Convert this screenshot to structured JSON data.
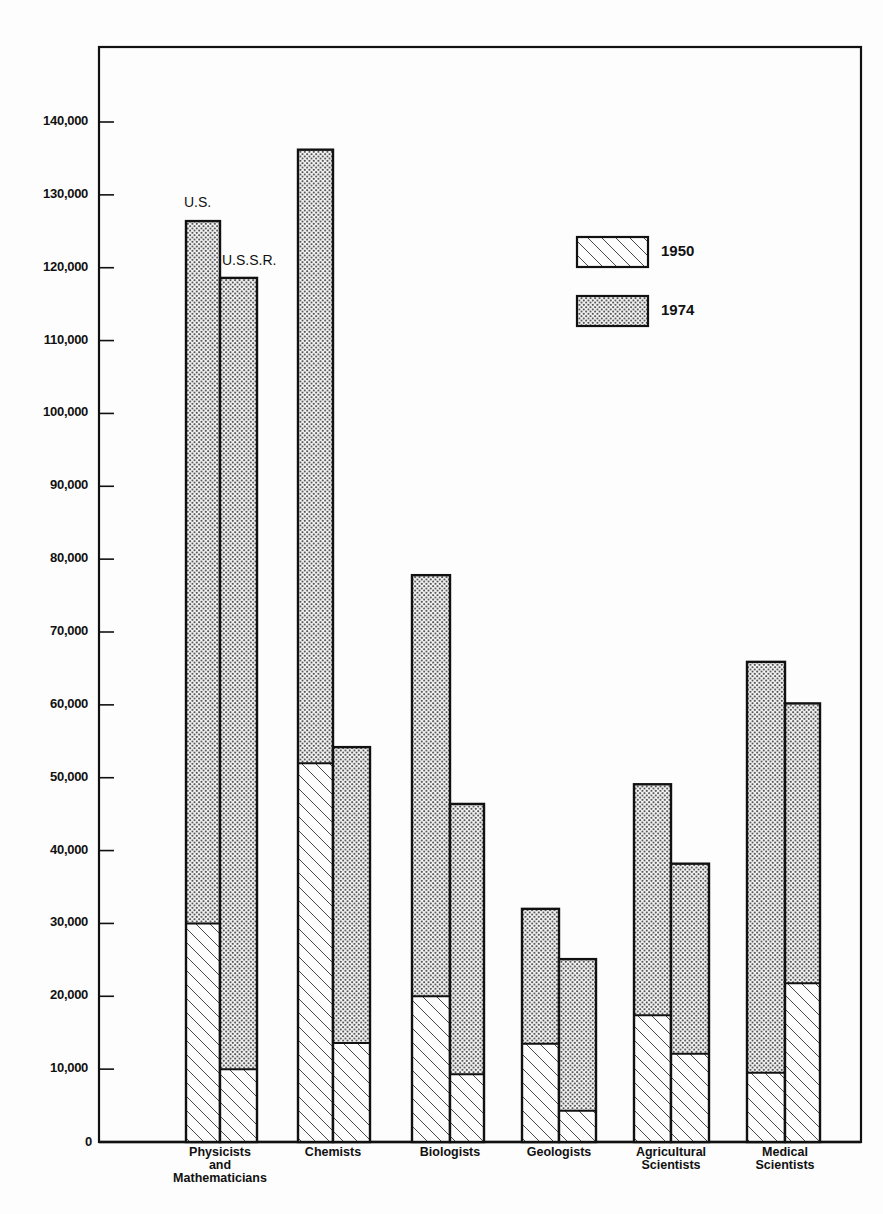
{
  "chart_data": {
    "type": "bar",
    "stacked_overlay": true,
    "title": "",
    "xlabel": "",
    "ylabel": "",
    "ylim": [
      0,
      150000
    ],
    "yticks": [
      0,
      10000,
      20000,
      30000,
      40000,
      50000,
      60000,
      70000,
      80000,
      90000,
      100000,
      110000,
      120000,
      130000,
      140000
    ],
    "ytick_labels": [
      "0",
      "10,000",
      "20,000",
      "30,000",
      "40,000",
      "50,000",
      "60,000",
      "70,000",
      "80,000",
      "90,000",
      "100,000",
      "110,000",
      "120,000",
      "130,000",
      "140,000"
    ],
    "grid": false,
    "categories": [
      "Physicists and Mathematicians",
      "Chemists",
      "Biologists",
      "Geologists",
      "Agricultural Scientists",
      "Medical Scientists"
    ],
    "category_labels": [
      "Physicists\nand\nMathematicians",
      "Chemists",
      "Biologists",
      "Geologists",
      "Agricultural\nScientists",
      "Medical\nScientists"
    ],
    "countries": [
      "U.S.",
      "U.S.S.R."
    ],
    "series": [
      {
        "name": "U.S. 1950",
        "country": "U.S.",
        "year": "1950",
        "values": [
          30000,
          52000,
          20000,
          13500,
          17400,
          9500
        ]
      },
      {
        "name": "U.S. 1974",
        "country": "U.S.",
        "year": "1974",
        "values": [
          126400,
          136200,
          77800,
          32000,
          49100,
          65900
        ]
      },
      {
        "name": "U.S.S.R. 1950",
        "country": "U.S.S.R.",
        "year": "1950",
        "values": [
          10000,
          13600,
          9300,
          4300,
          12100,
          21800
        ]
      },
      {
        "name": "U.S.S.R. 1974",
        "country": "U.S.S.R.",
        "year": "1974",
        "values": [
          118600,
          54200,
          46400,
          25100,
          38200,
          60200
        ]
      }
    ],
    "legend": {
      "position": "upper right",
      "entries": [
        {
          "label": "1950",
          "pattern": "diagonal-hatch"
        },
        {
          "label": "1974",
          "pattern": "dot-stipple"
        }
      ]
    },
    "annotations": [
      {
        "text": "U.S.",
        "target": "Physicists and Mathematicians / U.S."
      },
      {
        "text": "U.S.S.R.",
        "target": "Physicists and Mathematicians / U.S.S.R."
      }
    ]
  },
  "colors": {
    "ink": "#111111",
    "paper": "#fdfdfd"
  }
}
